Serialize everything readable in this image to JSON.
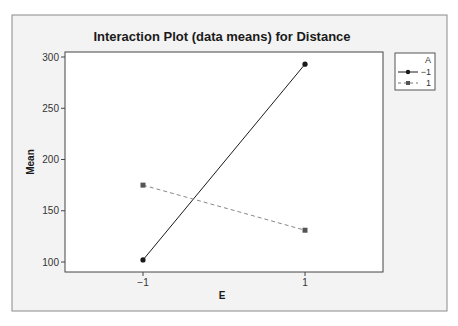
{
  "chart_data": {
    "type": "line",
    "title": "Interaction Plot (data means) for Distance",
    "xlabel": "E",
    "ylabel": "Mean",
    "categories": [
      "-1",
      "1"
    ],
    "x_tick_labels": [
      "−1",
      "1"
    ],
    "y_ticks": [
      100,
      150,
      200,
      250,
      300
    ],
    "y_tick_labels": [
      "100",
      "150",
      "200",
      "250",
      "300"
    ],
    "ylim": [
      92,
      306
    ],
    "grid": false,
    "legend_position": "right",
    "legend_title": "A",
    "series": [
      {
        "name": "−1",
        "values": [
          102,
          293
        ],
        "marker": "circle",
        "line_style": "solid",
        "color": "#1a1a1a"
      },
      {
        "name": "1",
        "values": [
          175,
          131
        ],
        "marker": "square",
        "line_style": "dashed",
        "color": "#666666"
      }
    ]
  },
  "colors": {
    "frame_background": "#f2f2f2",
    "plot_background": "#ffffff",
    "frame_border": "#8a8a8a",
    "axis": "#333333"
  }
}
